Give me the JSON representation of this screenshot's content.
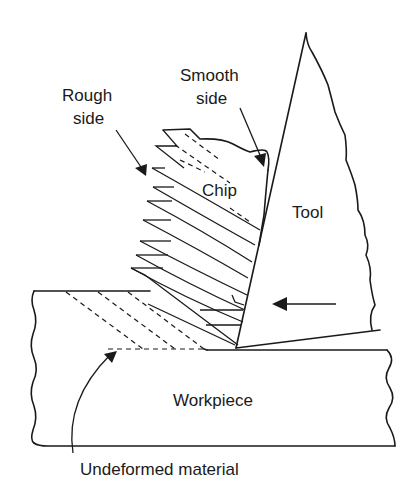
{
  "diagram": {
    "labels": {
      "rough_side": [
        "Rough",
        "side"
      ],
      "smooth_side": [
        "Smooth",
        "side"
      ],
      "chip": "Chip",
      "tool": "Tool",
      "workpiece": "Workpiece",
      "undeformed": "Undeformed material"
    },
    "colors": {
      "line": "#1a1a1a",
      "background": "#ffffff"
    }
  }
}
